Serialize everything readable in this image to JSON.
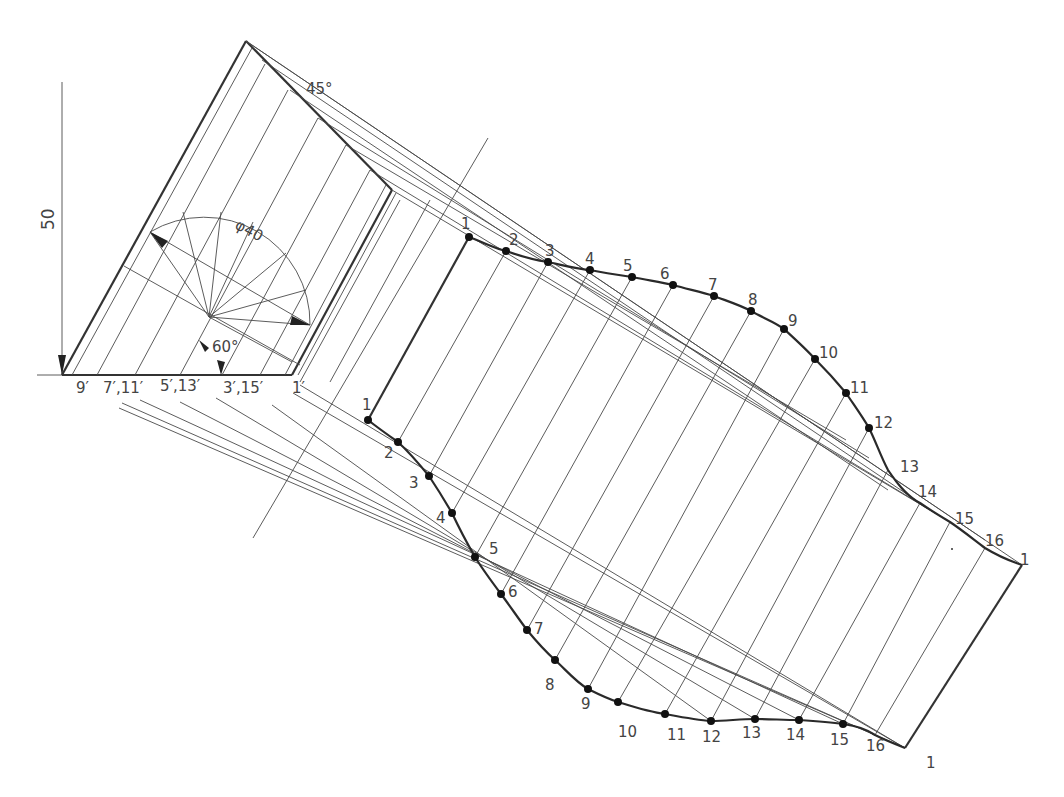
{
  "drawing": {
    "title": "Development of obliquely cut cylinder",
    "dimension_height": "50",
    "diameter_label": "φ40",
    "angle_top": "45°",
    "angle_bottom": "60°",
    "base_labels": [
      "9′",
      "7′,11′",
      "5′,13′",
      "3′,15′",
      "1′"
    ],
    "upper_points": [
      "1",
      "2",
      "3",
      "4",
      "5",
      "6",
      "7",
      "8",
      "9",
      "10",
      "11",
      "12",
      "13",
      "14",
      "15",
      "16",
      "1"
    ],
    "lower_points": [
      "1",
      "2",
      "3",
      "4",
      "5",
      "6",
      "7",
      "8",
      "9",
      "10",
      "11",
      "12",
      "13",
      "14",
      "15",
      "16",
      "1"
    ],
    "colors": {
      "line": "#4a4a4a",
      "thick": "#333333",
      "background": "#ffffff"
    }
  },
  "geometry": {
    "upper_curve": [
      [
        469,
        237
      ],
      [
        506,
        251
      ],
      [
        548,
        262
      ],
      [
        590,
        270
      ],
      [
        632,
        277
      ],
      [
        673,
        285
      ],
      [
        714,
        296
      ],
      [
        751,
        311
      ],
      [
        784,
        329
      ],
      [
        815,
        359
      ],
      [
        846,
        393
      ],
      [
        869,
        428
      ],
      [
        888,
        470
      ],
      [
        920,
        503
      ],
      [
        950,
        522
      ],
      [
        985,
        548
      ],
      [
        1022,
        565
      ]
    ],
    "lower_curve": [
      [
        368,
        420
      ],
      [
        398,
        442
      ],
      [
        429,
        476
      ],
      [
        452,
        513
      ],
      [
        475,
        557
      ],
      [
        501,
        594
      ],
      [
        527,
        630
      ],
      [
        555,
        660
      ],
      [
        588,
        689
      ],
      [
        618,
        702
      ],
      [
        665,
        714
      ],
      [
        711,
        721
      ],
      [
        755,
        719
      ],
      [
        799,
        720
      ],
      [
        843,
        724
      ],
      [
        875,
        735
      ],
      [
        905,
        748
      ]
    ]
  }
}
